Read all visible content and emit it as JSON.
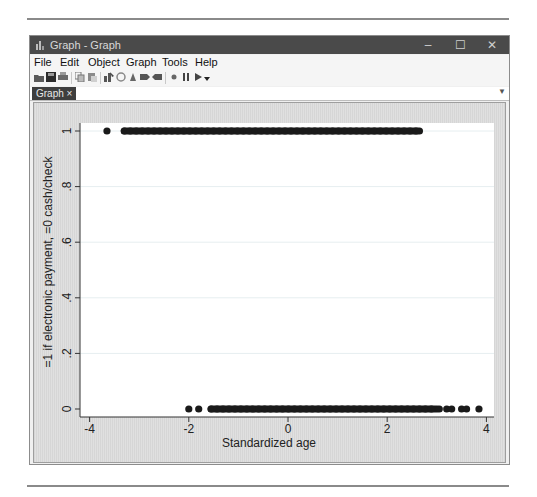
{
  "window": {
    "title": "Graph - Graph",
    "buttons": {
      "minimize": "–",
      "maximize": "☐",
      "close": "✕"
    }
  },
  "menu": {
    "items": [
      "File",
      "Edit",
      "Object",
      "Graph",
      "Tools",
      "Help"
    ]
  },
  "toolbar": {
    "icons": [
      "open-icon",
      "save-icon",
      "print-icon",
      "copy-icon",
      "paste-icon",
      "graph-editor-icon",
      "rename-icon",
      "recorder-icon",
      "back-icon",
      "forward-icon",
      "record-icon",
      "pause-icon",
      "play-icon",
      "dropdown-icon"
    ]
  },
  "tabs": [
    {
      "label": "Graph",
      "close": "×"
    }
  ],
  "colors": {
    "titlebar": "#4a4a4a",
    "tab": "#3e3e3e",
    "marker": "#1a1a1a",
    "plot_bg": "#ffffff",
    "grid": "#e6eef0"
  },
  "chart_data": {
    "type": "scatter",
    "title": "",
    "xlabel": "Standardized age",
    "ylabel": "=1 if electronic payment, =0 cash/check",
    "xlim": [
      -4.2,
      4.2
    ],
    "ylim": [
      -0.03,
      1.03
    ],
    "xticks": [
      -4,
      -2,
      0,
      2,
      4
    ],
    "xtick_labels": [
      "-4",
      "-2",
      "0",
      "2",
      "4"
    ],
    "yticks": [
      0,
      0.2,
      0.4,
      0.6,
      0.8,
      1
    ],
    "ytick_labels": [
      "0",
      ".2",
      ".4",
      ".6",
      ".8",
      "1"
    ],
    "grid": "horizontal",
    "legend": "none",
    "series": [
      {
        "name": "y=1 (electronic payment)",
        "y": 1,
        "isolated_points_x": [
          -3.65
        ],
        "dense_range_x": [
          -3.3,
          2.65
        ]
      },
      {
        "name": "y=0 (cash/check)",
        "y": 0,
        "isolated_points_x": [
          -2.0,
          -1.8,
          3.05,
          3.2,
          3.3,
          3.5,
          3.6,
          3.85
        ],
        "dense_range_x": [
          -1.55,
          3.0
        ]
      }
    ]
  }
}
